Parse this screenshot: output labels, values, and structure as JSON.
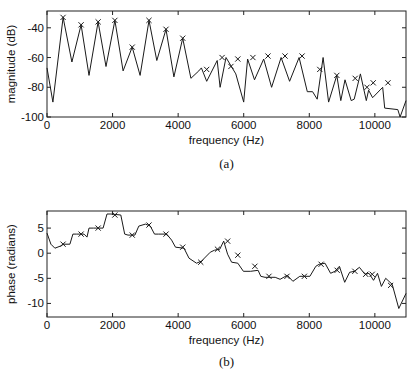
{
  "chart_data": [
    {
      "id": "a",
      "type": "line",
      "caption": "(a)",
      "title": "",
      "xlabel": "frequency (Hz)",
      "ylabel": "magnitude (dB)",
      "xlim": [
        0,
        10950
      ],
      "ylim": [
        -100,
        -28.7
      ],
      "xticks": [
        0,
        2000,
        4000,
        6000,
        8000,
        10000
      ],
      "xtick_labels": [
        "0",
        "2000",
        "4000",
        "6000",
        "8000",
        "10000"
      ],
      "yticks": [
        -40,
        -60,
        -80,
        -100
      ],
      "ytick_labels": [
        "-40",
        "-60",
        "-80",
        "-100"
      ],
      "grid": false,
      "legend": null,
      "series": [
        {
          "name": "magnitude spectrum",
          "style": "line",
          "x": [
            0,
            180,
            490,
            760,
            1040,
            1280,
            1560,
            1800,
            2070,
            2320,
            2600,
            2840,
            3110,
            3350,
            3630,
            3870,
            4140,
            4390,
            4630,
            4710,
            4870,
            5190,
            5280,
            5460,
            5760,
            6000,
            6120,
            6330,
            6610,
            6850,
            7140,
            7400,
            7690,
            7940,
            8100,
            8240,
            8420,
            8590,
            8840,
            8960,
            9090,
            9280,
            9370,
            9560,
            9740,
            9810,
            9930,
            10240,
            10300,
            10700,
            10770,
            10950
          ],
          "values": [
            -67,
            -90,
            -33,
            -63,
            -38,
            -72,
            -36,
            -66,
            -35,
            -69,
            -53,
            -72,
            -35,
            -62,
            -41,
            -73,
            -47,
            -74,
            -69,
            -67,
            -76,
            -62,
            -80,
            -60,
            -71,
            -90,
            -61,
            -75,
            -61,
            -80,
            -60,
            -76,
            -60,
            -83,
            -83,
            -88,
            -60,
            -90,
            -72,
            -89,
            -75,
            -89,
            -88,
            -71,
            -89,
            -82,
            -87,
            -80,
            -94,
            -95,
            -100,
            -89
          ]
        },
        {
          "name": "harmonic peaks (x markers)",
          "style": "marker-x",
          "x": [
            490,
            1040,
            1560,
            2070,
            2600,
            3110,
            3630,
            4140,
            4870,
            5340,
            5610,
            5820,
            6280,
            6740,
            7260,
            7780,
            8320,
            8840,
            9400,
            9760,
            9950,
            10400
          ],
          "values": [
            -33,
            -38,
            -36,
            -35,
            -53,
            -35,
            -41,
            -47,
            -68,
            -60,
            -66,
            -61,
            -60,
            -59,
            -59,
            -59,
            -68,
            -72,
            -74,
            -80,
            -77,
            -77
          ]
        }
      ]
    },
    {
      "id": "b",
      "type": "line",
      "caption": "(b)",
      "title": "",
      "xlabel": "frequency (Hz)",
      "ylabel": "phase (radians)",
      "xlim": [
        0,
        10950
      ],
      "ylim": [
        -12.7,
        8.4
      ],
      "xticks": [
        0,
        2000,
        4000,
        6000,
        8000,
        10000
      ],
      "xtick_labels": [
        "0",
        "2000",
        "4000",
        "6000",
        "8000",
        "10000"
      ],
      "yticks": [
        5,
        0,
        -5,
        -10
      ],
      "ytick_labels": [
        "5",
        "0",
        "-5",
        "-10"
      ],
      "grid": false,
      "legend": null,
      "series": [
        {
          "name": "phase spectrum",
          "style": "line",
          "x": [
            0,
            120,
            240,
            400,
            500,
            700,
            790,
            900,
            1130,
            1220,
            1280,
            1420,
            1710,
            1830,
            1950,
            2250,
            2370,
            2470,
            2680,
            2800,
            3000,
            3150,
            3280,
            3400,
            3650,
            3800,
            3920,
            4180,
            4330,
            4560,
            4710,
            4980,
            5110,
            5270,
            5390,
            5510,
            5630,
            5820,
            5990,
            6210,
            6440,
            6520,
            6650,
            6960,
            7110,
            7330,
            7500,
            7710,
            7830,
            8020,
            8200,
            8300,
            8480,
            8650,
            8780,
            8920,
            9080,
            9230,
            9380,
            9530,
            9700,
            9820,
            9960,
            10080,
            10200,
            10330,
            10530,
            10730,
            10950
          ],
          "values": [
            4.0,
            1.8,
            1.0,
            1.4,
            1.8,
            1.8,
            3.8,
            3.8,
            3.8,
            3.2,
            5.0,
            5.0,
            5.0,
            7.8,
            7.8,
            7.6,
            3.8,
            3.6,
            3.6,
            5.4,
            5.8,
            5.4,
            3.8,
            3.8,
            3.8,
            2.6,
            1.2,
            1.0,
            -1.0,
            -2.0,
            -1.6,
            0.2,
            0.6,
            0.8,
            2.4,
            -0.2,
            -1.8,
            -2.0,
            -3.6,
            -3.6,
            -3.4,
            -4.6,
            -4.8,
            -4.8,
            -5.2,
            -4.4,
            -5.6,
            -4.6,
            -4.6,
            -4.6,
            -2.6,
            -2.2,
            -2.0,
            -4.0,
            -3.6,
            -2.6,
            -5.8,
            -3.8,
            -3.6,
            -2.8,
            -4.2,
            -4.0,
            -5.4,
            -4.0,
            -6.6,
            -5.0,
            -6.2,
            -11.0,
            -8.0
          ]
        },
        {
          "name": "harmonic phase points (x markers)",
          "style": "marker-x",
          "x": [
            490,
            1040,
            1560,
            2070,
            2600,
            3110,
            3630,
            4140,
            4690,
            5200,
            5510,
            5820,
            6340,
            6770,
            7320,
            7850,
            8360,
            8850,
            9390,
            9720,
            9920,
            10480
          ],
          "values": [
            1.8,
            3.8,
            5.0,
            7.6,
            3.6,
            5.6,
            3.8,
            1.2,
            -1.8,
            0.8,
            2.4,
            -0.4,
            -2.6,
            -4.6,
            -4.6,
            -4.6,
            -2.2,
            -3.4,
            -3.6,
            -4.2,
            -4.2,
            -6.4
          ]
        }
      ]
    }
  ]
}
